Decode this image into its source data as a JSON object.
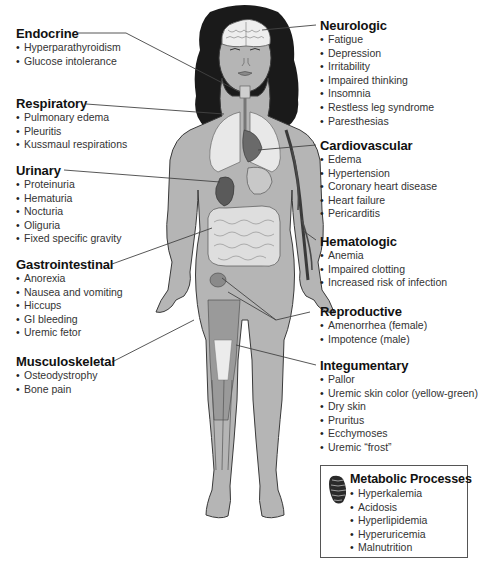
{
  "diagram": {
    "colors": {
      "skin": "#b5b5b5",
      "outline": "#3a3a3a",
      "hair": "#1a1a1a",
      "organ_light": "#e8e8e8",
      "organ_dark": "#6a6a6a",
      "kidney": "#5a5a5a",
      "leader_line": "#444444"
    }
  },
  "systems": {
    "endocrine": {
      "title": "Endocrine",
      "items": [
        "Hyperparathyroidism",
        "Glucose intolerance"
      ]
    },
    "respiratory": {
      "title": "Respiratory",
      "items": [
        "Pulmonary edema",
        "Pleuritis",
        "Kussmaul respirations"
      ]
    },
    "urinary": {
      "title": "Urinary",
      "items": [
        "Proteinuria",
        "Hematuria",
        "Nocturia",
        "Oliguria",
        "Fixed specific gravity"
      ]
    },
    "gastrointestinal": {
      "title": "Gastrointestinal",
      "items": [
        "Anorexia",
        "Nausea and vomiting",
        "Hiccups",
        "GI bleeding",
        "Uremic fetor"
      ]
    },
    "musculoskeletal": {
      "title": "Musculoskeletal",
      "items": [
        "Osteodystrophy",
        "Bone pain"
      ]
    },
    "neurologic": {
      "title": "Neurologic",
      "items": [
        "Fatigue",
        "Depression",
        "Irritability",
        "Impaired thinking",
        "Insomnia",
        "Restless leg syndrome",
        "Paresthesias"
      ]
    },
    "cardiovascular": {
      "title": "Cardiovascular",
      "items": [
        "Edema",
        "Hypertension",
        "Coronary heart disease",
        "Heart failure",
        "Pericarditis"
      ]
    },
    "hematologic": {
      "title": "Hematologic",
      "items": [
        "Anemia",
        "Impaired clotting",
        "Increased risk of infection"
      ]
    },
    "reproductive": {
      "title": "Reproductive",
      "items": [
        "Amenorrhea (female)",
        "Impotence (male)"
      ]
    },
    "integumentary": {
      "title": "Integumentary",
      "items": [
        "Pallor",
        "Uremic skin color (yellow-green)",
        "Dry skin",
        "Pruritus",
        "Ecchymoses",
        "Uremic “frost”"
      ]
    },
    "metabolic": {
      "title": "Metabolic Processes",
      "icon": "mitochondrion-icon",
      "items": [
        "Hyperkalemia",
        "Acidosis",
        "Hyperlipidemia",
        "Hyperuricemia",
        "Malnutrition"
      ]
    }
  }
}
